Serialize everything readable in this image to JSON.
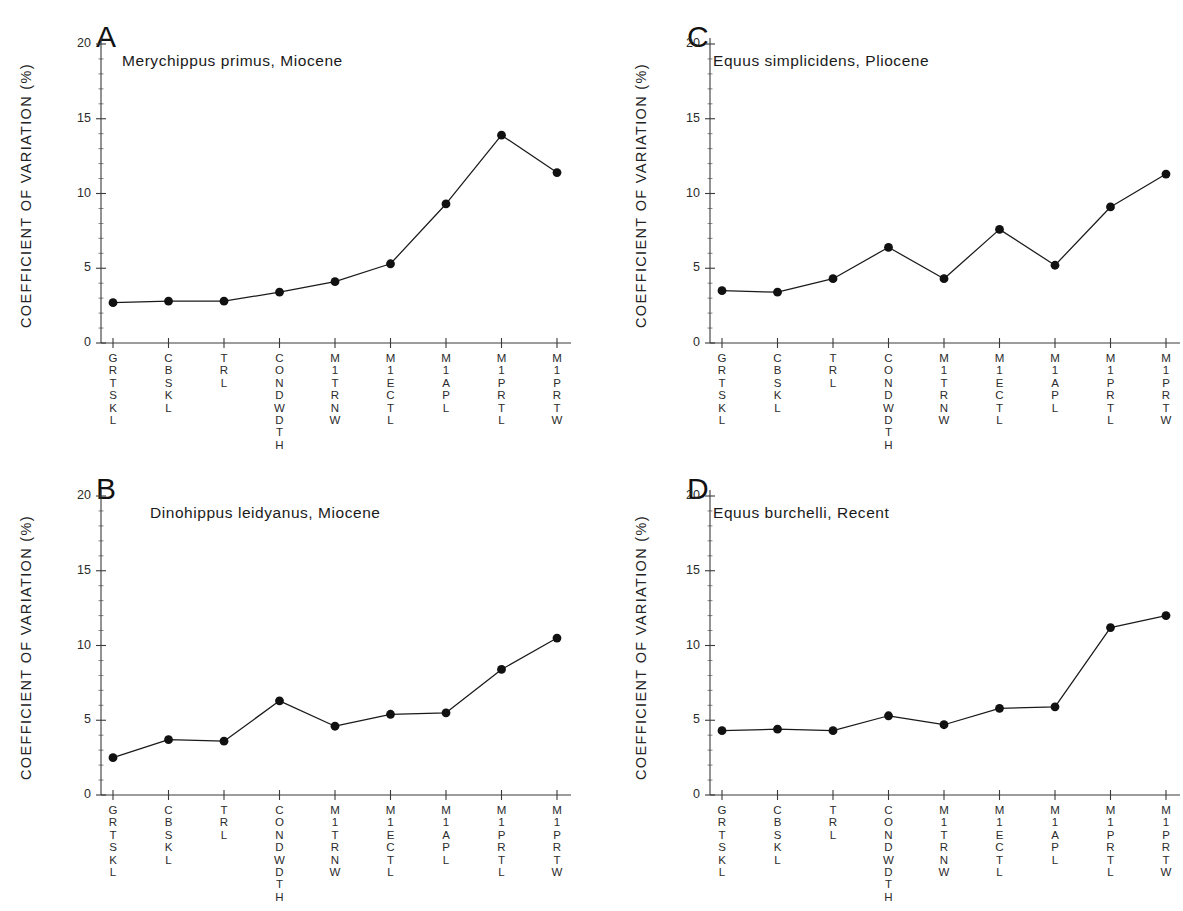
{
  "figure": {
    "background": "#ffffff",
    "line_color": "#1a1a1a",
    "marker_color": "#111111",
    "axis_color": "#3a3a3a"
  },
  "axes": {
    "ylabel": "COEFFICIENT OF VARIATION (%)",
    "yticks": [
      "0",
      "5",
      "10",
      "15",
      "20"
    ],
    "ytick_values": [
      0,
      5,
      10,
      15,
      20
    ],
    "ylim": [
      0,
      21
    ],
    "xticklabels": [
      "GRTSKL",
      "CBSKL",
      "TRL",
      "CONDWDTH",
      "M1TRNW",
      "M1ECTL",
      "M1APL",
      "M1PRTL",
      "M1PRTW"
    ]
  },
  "panels": [
    {
      "letter": "A",
      "title": "Merychippus primus, Miocene"
    },
    {
      "letter": "B",
      "title": "Dinohippus leidyanus, Miocene"
    },
    {
      "letter": "C",
      "title": "Equus simplicidens, Pliocene"
    },
    {
      "letter": "D",
      "title": "Equus burchelli, Recent"
    }
  ],
  "chart_data": [
    {
      "type": "line",
      "panel": "A",
      "title": "Merychippus primus, Miocene",
      "xlabel": "",
      "ylabel": "COEFFICIENT OF VARIATION (%)",
      "ylim": [
        0,
        21
      ],
      "grid": false,
      "legend": "none",
      "categories": [
        "GRTSKL",
        "CBSKL",
        "TRL",
        "CONDWDTH",
        "M1TRNW",
        "M1ECTL",
        "M1APL",
        "M1PRTL",
        "M1PRTW"
      ],
      "values": [
        2.7,
        2.8,
        2.8,
        3.4,
        4.1,
        5.3,
        9.3,
        13.9,
        11.4
      ]
    },
    {
      "type": "line",
      "panel": "B",
      "title": "Dinohippus leidyanus, Miocene",
      "xlabel": "",
      "ylabel": "COEFFICIENT OF VARIATION (%)",
      "ylim": [
        0,
        21
      ],
      "grid": false,
      "legend": "none",
      "categories": [
        "GRTSKL",
        "CBSKL",
        "TRL",
        "CONDWDTH",
        "M1TRNW",
        "M1ECTL",
        "M1APL",
        "M1PRTL",
        "M1PRTW"
      ],
      "values": [
        2.5,
        3.7,
        3.6,
        6.3,
        4.6,
        5.4,
        5.5,
        8.4,
        10.5
      ]
    },
    {
      "type": "line",
      "panel": "C",
      "title": "Equus simplicidens, Pliocene",
      "xlabel": "",
      "ylabel": "COEFFICIENT OF VARIATION (%)",
      "ylim": [
        0,
        21
      ],
      "grid": false,
      "legend": "none",
      "categories": [
        "GRTSKL",
        "CBSKL",
        "TRL",
        "CONDWDTH",
        "M1TRNW",
        "M1ECTL",
        "M1APL",
        "M1PRTL",
        "M1PRTW"
      ],
      "values": [
        3.5,
        3.4,
        4.3,
        6.4,
        4.3,
        7.6,
        5.2,
        9.1,
        11.3
      ]
    },
    {
      "type": "line",
      "panel": "D",
      "title": "Equus burchelli, Recent",
      "xlabel": "",
      "ylabel": "COEFFICIENT OF VARIATION (%)",
      "ylim": [
        0,
        21
      ],
      "grid": false,
      "legend": "none",
      "categories": [
        "GRTSKL",
        "CBSKL",
        "TRL",
        "CONDWDTH",
        "M1TRNW",
        "M1ECTL",
        "M1APL",
        "M1PRTL",
        "M1PRTW"
      ],
      "values": [
        4.3,
        4.4,
        4.3,
        5.3,
        4.7,
        5.8,
        5.9,
        11.2,
        12.0
      ]
    }
  ]
}
